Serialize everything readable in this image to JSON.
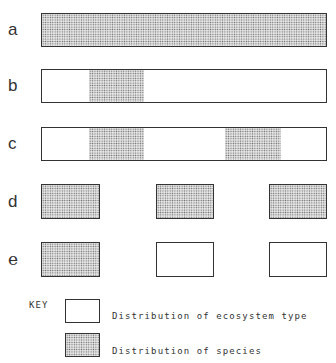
{
  "diagram": {
    "rows": [
      {
        "label": "a",
        "description": "Species distribution fills entire continuous ecosystem"
      },
      {
        "label": "b",
        "description": "Species occupies one patch of continuous ecosystem"
      },
      {
        "label": "c",
        "description": "Species occupies two patches of continuous ecosystem"
      },
      {
        "label": "d",
        "description": "Species occupies all three fragmented ecosystem patches"
      },
      {
        "label": "e",
        "description": "Species occupies one of three fragmented ecosystem patches"
      }
    ],
    "key": {
      "title": "KEY",
      "items": [
        {
          "label": "Distribution of ecosystem type",
          "style": "empty"
        },
        {
          "label": "Distribution of species",
          "style": "stippled"
        }
      ]
    },
    "colors": {
      "outline": "#333333",
      "stipple": "#6a6a6a",
      "background": "#ffffff"
    }
  }
}
